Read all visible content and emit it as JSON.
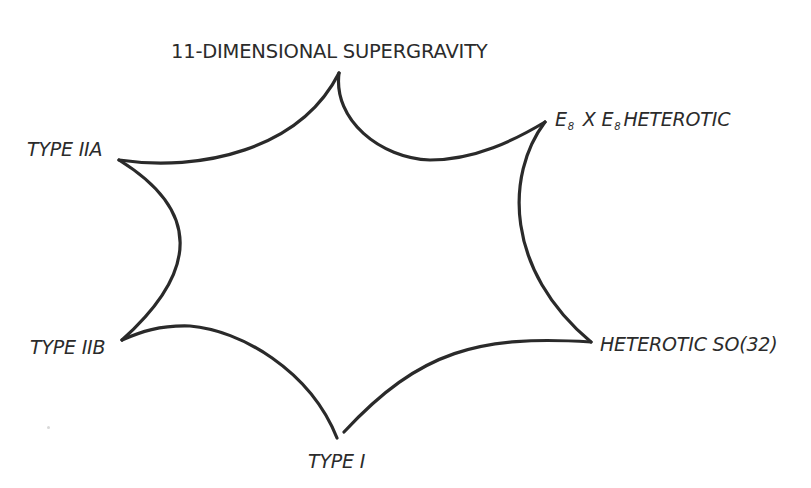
{
  "diagram": {
    "title": "",
    "type": "concave-star-hexagon",
    "stroke_color": "#2a2a2a",
    "vertices": [
      {
        "id": "sugra",
        "label": "11-DIMENSIONAL SUPERGRAVITY",
        "x": 339,
        "y": 73
      },
      {
        "id": "e8",
        "label_parts": [
          "E",
          "8",
          "X",
          "E",
          "8",
          "HETEROTIC"
        ],
        "label": "E8 X E8 HETEROTIC",
        "x": 545,
        "y": 122
      },
      {
        "id": "so32",
        "label": "HETEROTIC SO(32)",
        "x": 591,
        "y": 342
      },
      {
        "id": "type1",
        "label": "TYPE I",
        "x": 340,
        "y": 438
      },
      {
        "id": "iib",
        "label": "TYPE IIB",
        "x": 122,
        "y": 340
      },
      {
        "id": "iia",
        "label": "TYPE IIA",
        "x": 119,
        "y": 160
      }
    ],
    "labels": {
      "sugra": "11-DIMENSIONAL SUPERGRAVITY",
      "e8_a": "E",
      "e8_sub_a": "8",
      "e8_x": " X ",
      "e8_b": "E",
      "e8_sub_b": "8",
      "e8_rest": "HETEROTIC",
      "iia": "TYPE IIA",
      "iib": "TYPE IIB",
      "so32": "HETEROTIC SO(32)",
      "type1": "TYPE I"
    }
  }
}
